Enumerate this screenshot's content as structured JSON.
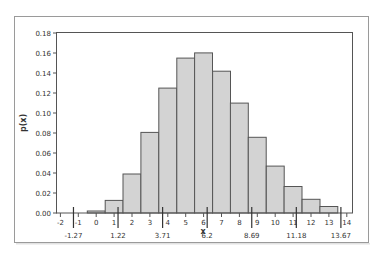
{
  "chart_data": {
    "type": "bar",
    "title": "",
    "xlabel": "x",
    "ylabel": "p(x)",
    "categories": [
      0,
      1,
      2,
      3,
      4,
      5,
      6,
      7,
      8,
      9,
      10,
      11,
      12,
      13
    ],
    "values": [
      0.002,
      0.0126,
      0.039,
      0.0806,
      0.1249,
      0.1549,
      0.1601,
      0.1418,
      0.1099,
      0.0757,
      0.0469,
      0.0265,
      0.0137,
      0.0065
    ],
    "xlim": [
      -2,
      14
    ],
    "ylim": [
      0,
      0.18
    ],
    "x_ticks": [
      -2,
      -1,
      0,
      1,
      2,
      3,
      4,
      5,
      6,
      7,
      8,
      9,
      10,
      11,
      12,
      13,
      14
    ],
    "y_ticks": [
      0.0,
      0.02,
      0.04,
      0.06,
      0.08,
      0.1,
      0.12,
      0.14,
      0.16,
      0.18
    ],
    "y_tick_labels": [
      "0.00",
      "0.02",
      "0.04",
      "0.06",
      "0.08",
      "0.10",
      "0.12",
      "0.14",
      "0.16",
      "0.18"
    ],
    "reference_marks": [
      {
        "value": -1.27,
        "label": "-1.27"
      },
      {
        "value": 1.22,
        "label": "1.22"
      },
      {
        "value": 3.71,
        "label": "3.71"
      },
      {
        "value": 6.2,
        "label": "6.2",
        "is_mean": true
      },
      {
        "value": 8.69,
        "label": "8.69"
      },
      {
        "value": 11.18,
        "label": "11.18"
      },
      {
        "value": 13.67,
        "label": "13.67"
      }
    ],
    "grid": false,
    "legend": null,
    "bar_color": "#d3d3d3",
    "bar_edge_color": "#555555"
  }
}
